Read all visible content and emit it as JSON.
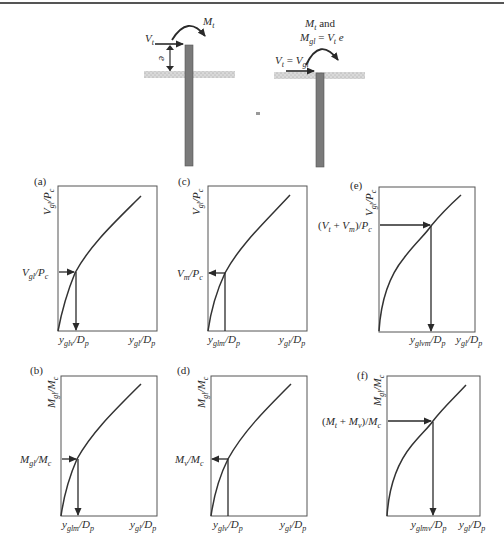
{
  "figure": {
    "equals_sign": "=",
    "top_diagram": {
      "left": {
        "lateral_load_label": "V_t",
        "moment_label": "M_t",
        "eccentricity_label": "e"
      },
      "right": {
        "moment_label_line1": "M_t and",
        "moment_label_line2": "M_gl = V_t e",
        "lateral_load_label": "V_t = V_gl"
      }
    },
    "panels": [
      {
        "id": "a",
        "tag": "(a)",
        "y_axis": "Vgl/Pc",
        "x_axis": "ygl/Dp",
        "marker_y_label": "Vgl/Pc",
        "marker_x_label": "yglv/Dp",
        "direction": "y-to-x"
      },
      {
        "id": "c",
        "tag": "(c)",
        "y_axis": "Vgl/Pc",
        "x_axis": "ygl/Dp",
        "marker_y_label": "Vm/Pc",
        "marker_x_label": "yglm/Dp",
        "direction": "x-to-y"
      },
      {
        "id": "e",
        "tag": "(e)",
        "y_axis": "Vgl/Pc",
        "x_axis": "ygl/Dp",
        "marker_y_label": "(Vt + Vm)/Pc",
        "marker_x_label": "yglvm/Dp",
        "direction": "y-to-x"
      },
      {
        "id": "b",
        "tag": "(b)",
        "y_axis": "Mgl/Mc",
        "x_axis": "ygl/Dp",
        "marker_y_label": "Mgl/Mc",
        "marker_x_label": "yglm/Dp",
        "direction": "y-to-x"
      },
      {
        "id": "d",
        "tag": "(d)",
        "y_axis": "Mgl/Mc",
        "x_axis": "ygl/Dp",
        "marker_y_label": "Mv/Mc",
        "marker_x_label": "yglv/Dp",
        "direction": "x-to-y"
      },
      {
        "id": "f",
        "tag": "(f)",
        "y_axis": "Mgl/Mc",
        "x_axis": "ygl/Dp",
        "marker_y_label": "(Mt + Mv)/Mc",
        "marker_x_label": "yglmv/Dp",
        "direction": "y-to-x"
      }
    ]
  }
}
